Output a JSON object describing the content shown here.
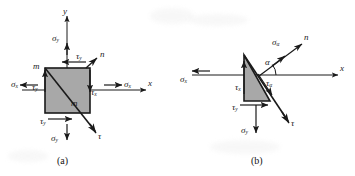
{
  "figure": {
    "title_hidden": "",
    "background_color": "#ffffff",
    "ink_color": "#1a1a1a",
    "fill_color": "#a8a8a8",
    "panels": [
      {
        "id": "a",
        "caption": "(a)",
        "shape": "square-stress-element",
        "axes": [
          {
            "name": "x-axis",
            "label": "x"
          },
          {
            "name": "y-axis",
            "label": "y"
          }
        ],
        "labels": [
          {
            "name": "sigma-y-top",
            "sym": "σ",
            "sub": "y",
            "x": 54,
            "y": 39
          },
          {
            "name": "tau-y-top",
            "sym": "τ",
            "sub": "y",
            "x": 78,
            "y": 57
          },
          {
            "name": "normal-n",
            "sym": "n",
            "sub": "",
            "x": 101,
            "y": 55
          },
          {
            "name": "corner-m-left",
            "sym": "m",
            "sub": "",
            "x": 34,
            "y": 67
          },
          {
            "name": "sigma-x-left",
            "sym": "σ",
            "sub": "x",
            "x": 14,
            "y": 85
          },
          {
            "name": "tau-y-left",
            "sym": "τ",
            "sub": "y",
            "x": 34,
            "y": 88
          },
          {
            "name": "corner-m-inner",
            "sym": "m",
            "sub": "",
            "x": 73,
            "y": 104
          },
          {
            "name": "tau-x-right",
            "sym": "τ",
            "sub": "x",
            "x": 91,
            "y": 92
          },
          {
            "name": "sigma-x-right",
            "sym": "σ",
            "sub": "x",
            "x": 126,
            "y": 85
          },
          {
            "name": "x-axis-label",
            "sym": "x",
            "sub": "",
            "x": 149,
            "y": 84
          },
          {
            "name": "y-axis-label",
            "sym": "y",
            "sub": "",
            "x": 63,
            "y": 12
          },
          {
            "name": "tau-y-bottom",
            "sym": "τ",
            "sub": "y",
            "x": 42,
            "y": 122
          },
          {
            "name": "sigma-y-bottom",
            "sym": "σ",
            "sub": "y",
            "x": 53,
            "y": 139
          },
          {
            "name": "tau-diagonal",
            "sym": "τ",
            "sub": "",
            "x": 97,
            "y": 137
          }
        ]
      },
      {
        "id": "b",
        "caption": "(b)",
        "shape": "triangular-wedge-stress-element",
        "axes": [
          {
            "name": "x-axis",
            "label": "x"
          }
        ],
        "labels": [
          {
            "name": "sigma-alpha",
            "sym": "σ",
            "sub": "α",
            "x": 276,
            "y": 43
          },
          {
            "name": "normal-n",
            "sym": "n",
            "sub": "",
            "x": 306,
            "y": 38
          },
          {
            "name": "angle-alpha",
            "sym": "α",
            "sub": "",
            "x": 267,
            "y": 63
          },
          {
            "name": "sigma-x-left",
            "sym": "σ",
            "sub": "x",
            "x": 182,
            "y": 80
          },
          {
            "name": "tau-x-left",
            "sym": "τ",
            "sub": "x",
            "x": 237,
            "y": 88
          },
          {
            "name": "tau-alpha",
            "sym": "τ",
            "sub": "α",
            "x": 268,
            "y": 84
          },
          {
            "name": "x-axis-label",
            "sym": "x",
            "sub": "",
            "x": 341,
            "y": 71
          },
          {
            "name": "tau-y-bottom",
            "sym": "τ",
            "sub": "y",
            "x": 234,
            "y": 108
          },
          {
            "name": "sigma-y-bottom",
            "sym": "σ",
            "sub": "y",
            "x": 243,
            "y": 131
          },
          {
            "name": "tau-shear",
            "sym": "τ",
            "sub": "",
            "x": 290,
            "y": 124
          }
        ]
      }
    ]
  }
}
